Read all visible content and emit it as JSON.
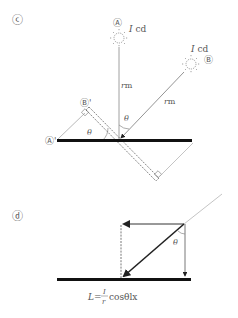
{
  "panel_c": {
    "label": "ⓒ",
    "source_a": {
      "label": "Ⓐ",
      "intensity": "I cd",
      "intensity_var": "I",
      "intensity_unit": "cd"
    },
    "source_b": {
      "label": "Ⓑ",
      "intensity": "I cd",
      "intensity_var": "I",
      "intensity_unit": "cd"
    },
    "distance_a": "rm",
    "distance_b": "rm",
    "distance_var": "r",
    "distance_unit": "m",
    "angle_top": "θ",
    "angle_left": "θ",
    "projection_a": "Ⓐ'",
    "projection_b": "Ⓑ'"
  },
  "panel_d": {
    "label": "ⓓ",
    "angle": "θ",
    "formula": {
      "lhs": "L=",
      "numerator": "I",
      "denominator": "r",
      "rest": "cosθlx"
    }
  },
  "colors": {
    "ground": "#111111",
    "line": "#777777",
    "arrow": "#222222",
    "text": "#555555"
  }
}
